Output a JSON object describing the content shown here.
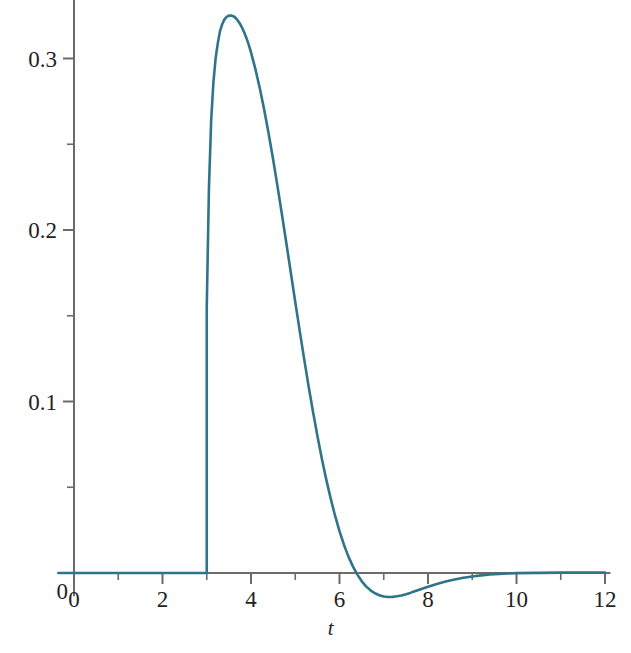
{
  "figure": {
    "background_color": "#ffffff",
    "axis_color": "#6e6a67",
    "text_color": "#231f20"
  },
  "axes": {
    "x_label": "t",
    "y_label": "",
    "x_tick_labels": [
      "0",
      "2",
      "4",
      "6",
      "8",
      "10",
      "12"
    ],
    "y_tick_labels": [
      "0",
      "0.1",
      "0.2",
      "0.3"
    ]
  },
  "chart_data": {
    "type": "line",
    "title": "",
    "subtitle": "",
    "xlabel": "t",
    "ylabel": "",
    "xlim": [
      -0.35,
      12.1
    ],
    "ylim": [
      -0.028,
      0.345
    ],
    "grid": false,
    "legend": null,
    "line_color": "#2f7489",
    "line_width": 2.6,
    "x_major_ticks": [
      0,
      2,
      4,
      6,
      8,
      10,
      12
    ],
    "x_minor_ticks": [
      1,
      3,
      5,
      7,
      9,
      11
    ],
    "y_major_ticks": [
      0,
      0.1,
      0.2,
      0.3
    ],
    "y_minor_ticks": [
      0.05,
      0.15,
      0.25
    ],
    "annotations": [],
    "series": [
      {
        "name": "y(t)",
        "x": [
          -0.35,
          0,
          0.5,
          1,
          1.5,
          2,
          2.5,
          2.9,
          2.98,
          3,
          3,
          3.05,
          3.1,
          3.15,
          3.2,
          3.25,
          3.3,
          3.35,
          3.4,
          3.45,
          3.5,
          3.55,
          3.6,
          3.65,
          3.7,
          3.75,
          3.8,
          3.85,
          3.9,
          3.95,
          4,
          4.1,
          4.2,
          4.3,
          4.4,
          4.5,
          4.6,
          4.7,
          4.8,
          4.9,
          5,
          5.1,
          5.2,
          5.3,
          5.4,
          5.5,
          5.6,
          5.7,
          5.8,
          5.9,
          6,
          6.1,
          6.2,
          6.3,
          6.4,
          6.5,
          6.6,
          6.7,
          6.8,
          6.9,
          7,
          7.1,
          7.2,
          7.3,
          7.4,
          7.5,
          7.6,
          7.7,
          7.8,
          7.9,
          8,
          8.2,
          8.4,
          8.6,
          8.8,
          9,
          9.2,
          9.4,
          9.6,
          9.8,
          10,
          10.5,
          11,
          11.5,
          12
        ],
        "y": [
          0,
          0,
          0,
          0,
          0,
          0,
          0,
          0,
          0,
          0,
          0.155,
          0.225,
          0.264,
          0.286,
          0.3,
          0.309,
          0.316,
          0.32,
          0.3228,
          0.3243,
          0.325,
          0.3251,
          0.3247,
          0.3237,
          0.3222,
          0.3203,
          0.3179,
          0.315,
          0.3117,
          0.3079,
          0.3036,
          0.2938,
          0.2825,
          0.2699,
          0.256,
          0.2411,
          0.2253,
          0.2089,
          0.1921,
          0.1751,
          0.1581,
          0.1413,
          0.125,
          0.1092,
          0.0942,
          0.08,
          0.0668,
          0.0546,
          0.0435,
          0.0334,
          0.0244,
          0.0165,
          0.0097,
          0.004,
          -0.0008,
          -0.0047,
          -0.0078,
          -0.0101,
          -0.0118,
          -0.013,
          -0.0137,
          -0.014,
          -0.0139,
          -0.0136,
          -0.0131,
          -0.0124,
          -0.0116,
          -0.0107,
          -0.0098,
          -0.0089,
          -0.008,
          -0.0064,
          -0.005,
          -0.0038,
          -0.0028,
          -0.002,
          -0.0014,
          -0.0009,
          -0.0005,
          -0.0003,
          -0.0001,
          0.0001,
          0.0002,
          0.0002,
          0.0002
        ]
      }
    ]
  }
}
